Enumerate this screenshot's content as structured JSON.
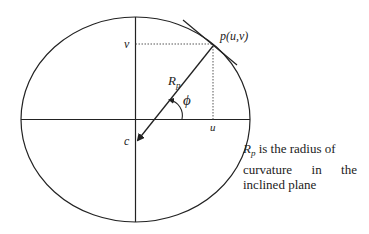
{
  "diagram": {
    "labels": {
      "v": "v",
      "point": "p(u,v)",
      "radius_main": "R",
      "radius_sub": "p",
      "angle": "ϕ",
      "u": "u",
      "center": "c"
    },
    "note": {
      "symbol_main": "R",
      "symbol_sub": "p",
      "line1_rest": " is the radius of",
      "line2": "curvature in the",
      "line3": "inclined plane"
    },
    "colors": {
      "stroke": "#222222",
      "background": "#ffffff"
    }
  }
}
